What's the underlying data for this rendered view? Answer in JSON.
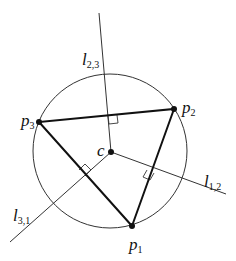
{
  "diagram": {
    "colors": {
      "background": "#ffffff",
      "stroke": "#111111",
      "thin_stroke": "#333333"
    },
    "circle": {
      "cx": 110,
      "cy": 151,
      "r": 77
    },
    "center": {
      "name": "c",
      "x": 111,
      "y": 152,
      "label": "c"
    },
    "points": [
      {
        "id": "p1",
        "x": 132,
        "y": 226,
        "label": "p",
        "sub": "1"
      },
      {
        "id": "p2",
        "x": 174,
        "y": 109,
        "label": "p",
        "sub": "2"
      },
      {
        "id": "p3",
        "x": 39,
        "y": 122,
        "label": "p",
        "sub": "3"
      }
    ],
    "bisectors": [
      {
        "id": "l23",
        "label": "l",
        "sub": "2,3",
        "x1": 111,
        "y1": 152,
        "x2": 99,
        "y2": 13
      },
      {
        "id": "l12",
        "label": "l",
        "sub": "1,2",
        "x1": 111,
        "y1": 152,
        "x2": 226,
        "y2": 194
      },
      {
        "id": "l31",
        "label": "l",
        "sub": "3,1",
        "x1": 111,
        "y1": 152,
        "x2": 10,
        "y2": 242
      }
    ],
    "labels": {
      "l23": {
        "main": "l",
        "sub": "2,3"
      },
      "l12": {
        "main": "l",
        "sub": "1,2"
      },
      "l31": {
        "main": "l",
        "sub": "3,1"
      },
      "p1": {
        "main": "p",
        "sub": "1"
      },
      "p2": {
        "main": "p",
        "sub": "2"
      },
      "p3": {
        "main": "p",
        "sub": "3"
      },
      "c": {
        "main": "c"
      }
    }
  }
}
